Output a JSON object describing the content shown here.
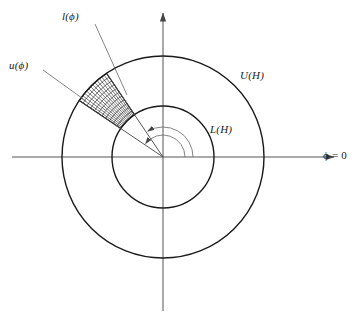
{
  "figure": {
    "type": "annulus-sector-diagram",
    "background_color": "#ffffff",
    "stroke_color": "#1a1a1a",
    "hatch_color": "#333333",
    "axis_color": "#555555"
  },
  "labels": {
    "lower_bound_fn": "l(ϕ)",
    "upper_bound_fn": "u(ϕ)",
    "outer_circle": "U(H)",
    "inner_circle": "L(H)",
    "axis_reference": "ϕ = 0"
  },
  "geometry": {
    "center": {
      "x": 163,
      "y": 157
    },
    "outer_radius": 101,
    "inner_radius": 51,
    "sector": {
      "start_angle_deg": 124,
      "end_angle_deg": 146,
      "inner_radius": 51,
      "outer_radius": 101,
      "hatch_radial_divisions": 11,
      "hatch_angular_divisions": 13
    },
    "angle_arcs": [
      {
        "name": "angle-arc-lower",
        "radius": 30,
        "from_deg": 0,
        "to_deg": 124
      },
      {
        "name": "angle-arc-upper",
        "radius": 22,
        "from_deg": 0,
        "to_deg": 146
      }
    ],
    "axes": {
      "x_axis": {
        "x1": 12,
        "x2": 343,
        "y": 157
      },
      "y_axis": {
        "y1": 5,
        "y2": 311,
        "x": 163
      }
    },
    "leaders": [
      {
        "name": "leader-l-phi",
        "x1": 95,
        "y1": 24,
        "x2": 127,
        "y2": 95
      },
      {
        "name": "leader-u-phi",
        "x1": 43,
        "y1": 70,
        "x2": 86,
        "y2": 101
      }
    ]
  },
  "label_positions": {
    "lower_bound_fn": {
      "left": 62,
      "top": 11
    },
    "upper_bound_fn": {
      "left": 9,
      "top": 60
    },
    "outer_circle": {
      "left": 240,
      "top": 70
    },
    "inner_circle": {
      "left": 210,
      "top": 124
    },
    "axis_reference": {
      "left": 323,
      "top": 150
    }
  }
}
